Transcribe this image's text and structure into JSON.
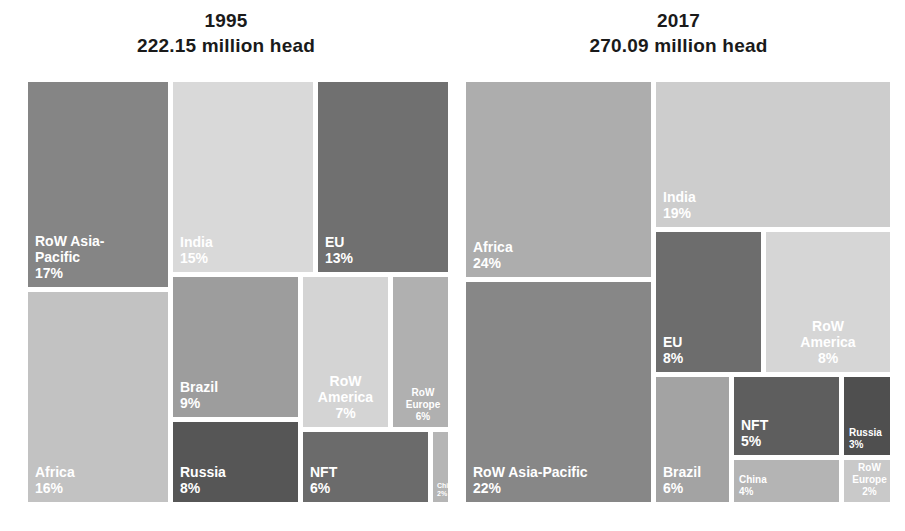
{
  "chart_data": {
    "type": "treemap",
    "title": "",
    "panels": [
      {
        "year": "1995",
        "total": "222.15 million head",
        "unit": "million head",
        "total_value": 222.15,
        "categories": [
          "RoW Asia-Pacific",
          "Africa",
          "India",
          "EU",
          "Brazil",
          "Russia",
          "RoW America",
          "RoW Europe",
          "NFT",
          "China"
        ],
        "values": [
          17,
          16,
          15,
          13,
          9,
          8,
          7,
          6,
          6,
          2
        ],
        "tiles": [
          {
            "label": "RoW Asia-\nPacific",
            "pct": "17%",
            "value": 17,
            "color": "#858585",
            "x": 0,
            "y": 0,
            "w": 140,
            "h": 205
          },
          {
            "label": "Africa",
            "pct": "16%",
            "value": 16,
            "color": "#c2c2c2",
            "x": 0,
            "y": 210,
            "w": 140,
            "h": 210
          },
          {
            "label": "India",
            "pct": "15%",
            "value": 15,
            "color": "#d9d9d9",
            "x": 145,
            "y": 0,
            "w": 140,
            "h": 190
          },
          {
            "label": "EU",
            "pct": "13%",
            "value": 13,
            "color": "#707070",
            "x": 290,
            "y": 0,
            "w": 130,
            "h": 190
          },
          {
            "label": "Brazil",
            "pct": "9%",
            "value": 9,
            "color": "#9d9d9d",
            "x": 145,
            "y": 195,
            "w": 125,
            "h": 140
          },
          {
            "label": "Russia",
            "pct": "8%",
            "value": 8,
            "color": "#565656",
            "x": 145,
            "y": 340,
            "w": 125,
            "h": 80
          },
          {
            "label": "RoW\nAmerica",
            "pct": "7%",
            "value": 7,
            "color": "#d4d4d4",
            "x": 275,
            "y": 195,
            "w": 85,
            "h": 150
          },
          {
            "label": "RoW\nEurope",
            "pct": "6%",
            "value": 6,
            "color": "#b0b0b0",
            "x": 365,
            "y": 195,
            "w": 55,
            "h": 150
          },
          {
            "label": "NFT",
            "pct": "6%",
            "value": 6,
            "color": "#6b6b6b",
            "x": 275,
            "y": 350,
            "w": 125,
            "h": 70
          },
          {
            "label": "China",
            "pct": "2%",
            "value": 2,
            "color": "#b5b5b5",
            "x": 405,
            "y": 350,
            "w": 15,
            "h": 70
          }
        ]
      },
      {
        "year": "2017",
        "total": "270.09 million head",
        "unit": "million head",
        "total_value": 270.09,
        "categories": [
          "Africa",
          "RoW Asia-Pacific",
          "India",
          "EU",
          "RoW America",
          "Brazil",
          "NFT",
          "China",
          "Russia",
          "RoW Europe"
        ],
        "values": [
          24,
          22,
          19,
          8,
          8,
          6,
          5,
          4,
          3,
          2
        ],
        "tiles": [
          {
            "label": "Africa",
            "pct": "24%",
            "value": 24,
            "color": "#adadad",
            "x": 0,
            "y": 0,
            "w": 185,
            "h": 195
          },
          {
            "label": "RoW Asia-Pacific",
            "pct": "22%",
            "value": 22,
            "color": "#878787",
            "x": 0,
            "y": 200,
            "w": 185,
            "h": 220
          },
          {
            "label": "India",
            "pct": "19%",
            "value": 19,
            "color": "#cdcdcd",
            "x": 190,
            "y": 0,
            "w": 234,
            "h": 145
          },
          {
            "label": "EU",
            "pct": "8%",
            "value": 8,
            "color": "#6d6d6d",
            "x": 190,
            "y": 150,
            "w": 105,
            "h": 140
          },
          {
            "label": "RoW\nAmerica",
            "pct": "8%",
            "value": 8,
            "color": "#d6d6d6",
            "x": 300,
            "y": 150,
            "w": 124,
            "h": 140
          },
          {
            "label": "Brazil",
            "pct": "6%",
            "value": 6,
            "color": "#a3a3a3",
            "x": 190,
            "y": 295,
            "w": 73,
            "h": 125
          },
          {
            "label": "NFT",
            "pct": "5%",
            "value": 5,
            "color": "#5e5e5e",
            "x": 268,
            "y": 295,
            "w": 105,
            "h": 78
          },
          {
            "label": "China",
            "pct": "4%",
            "value": 4,
            "color": "#b4b4b4",
            "x": 268,
            "y": 378,
            "w": 105,
            "h": 42
          },
          {
            "label": "Russia",
            "pct": "3%",
            "value": 3,
            "color": "#4f4f4f",
            "x": 378,
            "y": 295,
            "w": 46,
            "h": 78
          },
          {
            "label": "RoW\nEurope",
            "pct": "2%",
            "value": 2,
            "color": "#c9c9c9",
            "x": 378,
            "y": 378,
            "w": 46,
            "h": 42
          }
        ]
      }
    ],
    "legend": null,
    "grid": false,
    "label_color": "#ffffff",
    "background": "#ffffff",
    "gutter_color": "#ffffff"
  }
}
